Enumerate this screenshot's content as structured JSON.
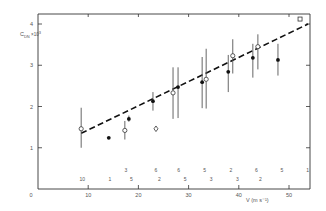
{
  "chart_data": {
    "type": "scatter",
    "title": "",
    "xlabel": "V (m s⁻¹)",
    "ylabel": "C_DN × 10³",
    "ylabel_main": "C",
    "ylabel_sub": "DN",
    "ylabel_mult": "×10",
    "ylabel_exp": "3",
    "xlim": [
      0,
      54
    ],
    "ylim": [
      0,
      4.2
    ],
    "x_ticks": [
      0,
      10,
      20,
      30,
      40,
      50
    ],
    "x_tick_labels": [
      "0",
      "10",
      "20",
      "30",
      "40",
      "50"
    ],
    "y_ticks": [
      1,
      2,
      3,
      4
    ],
    "y_tick_labels": [
      "1",
      "2",
      "3",
      "4"
    ],
    "grid": false,
    "legend": null,
    "series": [
      {
        "name": "open circles",
        "marker": "open-circle",
        "points": [
          {
            "x": 8.6,
            "y": 1.46,
            "ylo": 1.0,
            "yhi": 1.97
          },
          {
            "x": 17.3,
            "y": 1.42,
            "ylo": 1.2,
            "yhi": 1.65
          },
          {
            "x": 26.9,
            "y": 2.33,
            "ylo": 1.7,
            "yhi": 2.95
          },
          {
            "x": 33.5,
            "y": 2.66,
            "ylo": 1.95,
            "yhi": 3.4
          },
          {
            "x": 38.8,
            "y": 3.23,
            "ylo": 2.8,
            "yhi": 3.63
          },
          {
            "x": 43.8,
            "y": 3.45,
            "ylo": 2.9,
            "yhi": 3.75
          }
        ]
      },
      {
        "name": "filled circles",
        "marker": "filled-circle",
        "points": [
          {
            "x": 14.1,
            "y": 1.24
          },
          {
            "x": 18.1,
            "y": 1.7,
            "ylo": 1.63,
            "yhi": 1.78
          },
          {
            "x": 22.9,
            "y": 2.13,
            "ylo": 1.9,
            "yhi": 2.35
          },
          {
            "x": 27.9,
            "y": 2.47,
            "ylo": 1.72,
            "yhi": 2.95
          },
          {
            "x": 32.7,
            "y": 2.59,
            "ylo": 1.96,
            "yhi": 3.2
          },
          {
            "x": 37.9,
            "y": 2.84,
            "ylo": 2.35,
            "yhi": 3.25
          },
          {
            "x": 42.8,
            "y": 3.18,
            "ylo": 2.7,
            "yhi": 3.52
          },
          {
            "x": 47.8,
            "y": 3.13,
            "ylo": 2.75,
            "yhi": 3.52
          }
        ]
      },
      {
        "name": "open diamond",
        "marker": "open-diamond",
        "points": [
          {
            "x": 23.5,
            "y": 1.46
          }
        ]
      },
      {
        "name": "open square",
        "marker": "open-square",
        "points": [
          {
            "x": 52.2,
            "y": 4.12
          }
        ]
      }
    ],
    "fit_line": {
      "style": "dashed",
      "x": [
        8.6,
        53.8
      ],
      "y": [
        1.35,
        4.0
      ]
    },
    "annotations": {
      "count_row_upper": [
        {
          "x": 17.5,
          "label": "3"
        },
        {
          "x": 23.5,
          "label": "6"
        },
        {
          "x": 28.0,
          "label": "6"
        },
        {
          "x": 33.2,
          "label": "5"
        },
        {
          "x": 38.4,
          "label": "2"
        },
        {
          "x": 43.5,
          "label": "6"
        },
        {
          "x": 48.6,
          "label": "5"
        },
        {
          "x": 53.7,
          "label": "1"
        }
      ],
      "count_row_lower": [
        {
          "x": 8.8,
          "label": "10"
        },
        {
          "x": 14.3,
          "label": "1"
        },
        {
          "x": 18.6,
          "label": "5"
        },
        {
          "x": 24.2,
          "label": "2"
        },
        {
          "x": 29.3,
          "label": "5"
        },
        {
          "x": 34.5,
          "label": "3"
        },
        {
          "x": 39.7,
          "label": "3"
        },
        {
          "x": 44.3,
          "label": "2"
        }
      ]
    }
  }
}
